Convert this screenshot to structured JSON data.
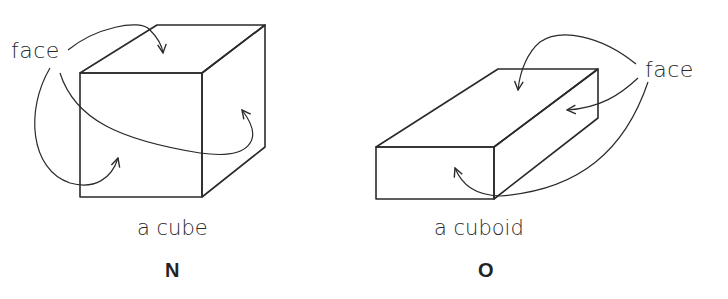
{
  "figures": [
    {
      "id": "N",
      "shape": "cube",
      "caption": "a cube",
      "letter": "N",
      "pointer_label": "face",
      "arrow_count": 3
    },
    {
      "id": "O",
      "shape": "cuboid",
      "caption": "a cuboid",
      "letter": "O",
      "pointer_label": "face",
      "arrow_count": 3
    }
  ],
  "colors": {
    "stroke": "#2a2a2a",
    "background": "#ffffff"
  }
}
